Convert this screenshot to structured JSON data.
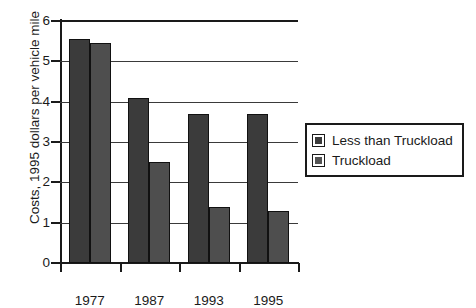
{
  "chart_data": {
    "type": "bar",
    "title": "",
    "xlabel": "",
    "ylabel": "Costs, 1995 dollars per vehicle mile",
    "categories": [
      "1977",
      "1987",
      "1993",
      "1995"
    ],
    "series": [
      {
        "name": "Less than Truckload",
        "values": [
          5.55,
          4.1,
          3.7,
          3.7
        ],
        "color": "#3b3b3b"
      },
      {
        "name": "Truckload",
        "values": [
          5.45,
          2.5,
          1.4,
          1.3
        ],
        "color": "#4e4e4e"
      }
    ],
    "ylim": [
      0,
      6
    ],
    "yticks": [
      "0",
      "1",
      "2",
      "3",
      "4",
      "5",
      "6"
    ],
    "grid": true,
    "legend_position": "right"
  },
  "legend": {
    "items": [
      {
        "label": "Less than Truckload"
      },
      {
        "label": "Truckload"
      }
    ]
  }
}
